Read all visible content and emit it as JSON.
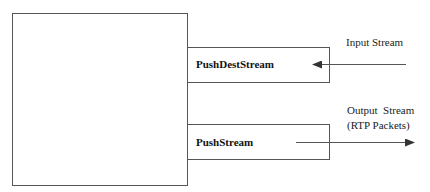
{
  "diagram": {
    "components": [
      {
        "id": "main-block",
        "label": ""
      },
      {
        "id": "push-dest-stream",
        "label": "PushDestStream"
      },
      {
        "id": "push-stream",
        "label": "PushStream"
      }
    ],
    "arrows": [
      {
        "id": "input-arrow",
        "direction": "into push-dest-stream",
        "label": "Input Stream"
      },
      {
        "id": "output-arrow",
        "direction": "out of push-stream",
        "label_line1": "Output  Stream",
        "label_line2": "(RTP Packets)"
      }
    ],
    "colors": {
      "stroke": "#555555",
      "arrow": "#333333",
      "text": "#222222"
    }
  }
}
